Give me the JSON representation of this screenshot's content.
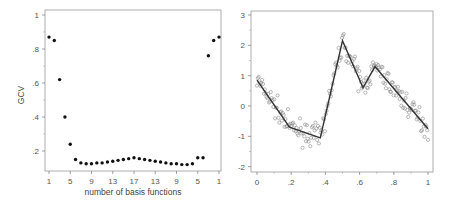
{
  "chart_data": [
    {
      "type": "scatter",
      "title": "",
      "xlabel": "number of basis functions",
      "ylabel": "GCV",
      "ylim": [
        0.1,
        1.0
      ],
      "grid": false,
      "x_tick_labels": [
        "1",
        "5",
        "9",
        "13",
        "17",
        "13",
        "9",
        "5",
        "1"
      ],
      "y_tick_labels": [
        "1",
        ".8",
        ".6",
        ".4",
        ".2"
      ],
      "x_index": [
        1,
        2,
        3,
        4,
        5,
        6,
        7,
        8,
        9,
        10,
        11,
        12,
        13,
        14,
        15,
        16,
        17,
        18,
        19,
        20,
        21,
        22,
        23,
        24,
        25,
        26,
        27,
        28,
        29,
        30,
        31,
        32,
        33
      ],
      "x_label_per_index": [
        1,
        2,
        3,
        4,
        5,
        6,
        7,
        8,
        9,
        10,
        11,
        12,
        13,
        14,
        15,
        16,
        17,
        16,
        15,
        14,
        13,
        12,
        11,
        10,
        9,
        8,
        7,
        6,
        5,
        4,
        3,
        2,
        1
      ],
      "values": [
        0.87,
        0.85,
        0.62,
        0.4,
        0.24,
        0.15,
        0.13,
        0.125,
        0.125,
        0.13,
        0.13,
        0.135,
        0.14,
        0.145,
        0.15,
        0.155,
        0.16,
        0.155,
        0.15,
        0.145,
        0.14,
        0.135,
        0.13,
        0.125,
        0.125,
        0.12,
        0.12,
        0.125,
        0.16,
        0.16,
        0.76,
        0.85,
        0.87
      ]
    },
    {
      "type": "scatter",
      "title": "",
      "xlabel": "",
      "ylabel": "",
      "xlim": [
        0,
        1
      ],
      "ylim": [
        -2,
        3
      ],
      "grid": false,
      "x_tick_labels": [
        "0",
        ".2",
        ".4",
        ".6",
        ".8",
        "1"
      ],
      "y_tick_labels": [
        "3",
        "2",
        "1",
        "0",
        "-1",
        "-2"
      ],
      "fitted_line": {
        "x": [
          0,
          0.19,
          0.37,
          0.5,
          0.62,
          0.69,
          1.0
        ],
        "y": [
          0.85,
          -0.7,
          -1.05,
          2.15,
          0.6,
          1.3,
          -0.75
        ]
      },
      "points_description": "noisy observations (~200 open circles) scattered around the piecewise-linear fitted line"
    }
  ],
  "left_panel": {
    "ylabel": "GCV",
    "xlabel": "number of basis functions",
    "x_ticks": [
      "1",
      "5",
      "9",
      "13",
      "17",
      "13",
      "9",
      "5",
      "1"
    ],
    "y_ticks": [
      "1",
      ".8",
      ".6",
      ".4",
      ".2"
    ]
  },
  "right_panel": {
    "x_ticks": [
      "0",
      ".2",
      ".4",
      ".6",
      ".8",
      "1"
    ],
    "y_ticks": [
      "3",
      "2",
      "1",
      "0",
      "-1",
      "-2"
    ]
  }
}
